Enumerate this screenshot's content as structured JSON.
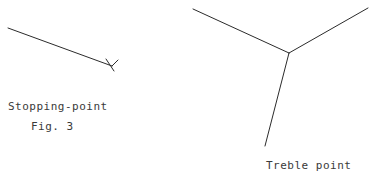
{
  "figure": {
    "number": "Fig. 3",
    "background_color": "#ffffff",
    "ink_color": "#2b2b2b",
    "width": 371,
    "height": 173
  },
  "labels": {
    "stopping_point": "Stopping-point",
    "fig_number": "Fig. 3",
    "treble_point": "Treble point"
  },
  "diagrams": {
    "stopping_point": {
      "name": "stopping-point-diagram",
      "description": "single straight line descending to the right, terminating in a short cross tick",
      "main_line": "M 8,28 L 112,66",
      "terminal_tick": "M 106,59 L 114,71",
      "terminal_tick_2": "M 112,66 L 118,60"
    },
    "treble_point": {
      "name": "treble-point-diagram",
      "description": "three lines meeting at a single junction forming a Y shape",
      "junction": {
        "x": 289,
        "y": 53
      },
      "branch_upper_left": "M 193,9 L 289,53",
      "branch_upper_right": "M 368,8 L 289,53",
      "branch_lower": "M 289,53 L 265,146"
    }
  }
}
